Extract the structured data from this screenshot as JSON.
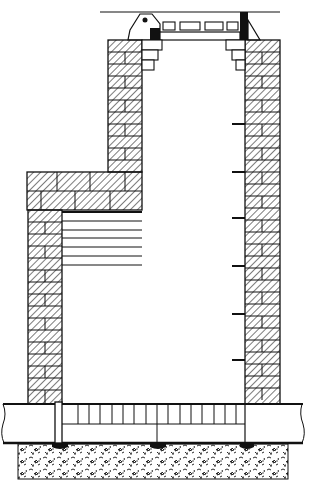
{
  "figure": {
    "title": "",
    "colors": {
      "ink": "#111111",
      "paper": "#ffffff",
      "hatch": "#222222"
    },
    "components": [
      {
        "name": "ground-line",
        "label": ""
      },
      {
        "name": "manhole-cover",
        "label": ""
      },
      {
        "name": "hinge",
        "label": ""
      },
      {
        "name": "brick-walls",
        "label": ""
      },
      {
        "name": "corbel-steps",
        "label": ""
      },
      {
        "name": "ladder-rungs",
        "label": "",
        "count": 6
      },
      {
        "name": "side-ledge-planks",
        "label": "",
        "count": 6
      },
      {
        "name": "pipe",
        "label": ""
      },
      {
        "name": "channel-bars",
        "label": ""
      },
      {
        "name": "concrete-base",
        "label": ""
      }
    ]
  }
}
